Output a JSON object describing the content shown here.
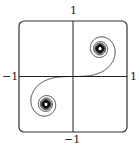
{
  "chart_data": {
    "type": "line",
    "title": "",
    "xlabel": "",
    "ylabel": "",
    "xlim": [
      -1,
      1
    ],
    "ylim": [
      -1,
      1
    ],
    "grid": false,
    "axes_through_origin": true,
    "tick_labels": {
      "top": "1",
      "bottom": "-1",
      "left": "-1",
      "right": "1"
    },
    "series": [
      {
        "name": "Cornu spiral",
        "parametric": "x = ∫0^t cos(πu²/2) du, y = ∫0^t sin(πu²/2) du",
        "t_range": [
          -8,
          8
        ],
        "limit_points": [
          [
            0.5,
            0.5
          ],
          [
            -0.5,
            -0.5
          ]
        ],
        "color": "#111111"
      }
    ]
  },
  "labels": {
    "top": "1",
    "bottom": "−1",
    "left": "−1",
    "right": "1"
  },
  "colors": {
    "curve": "#111111",
    "axes": "#222222",
    "frame": "#333333"
  }
}
